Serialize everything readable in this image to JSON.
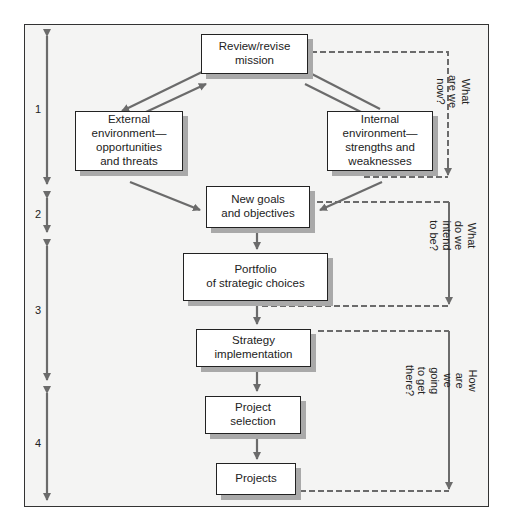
{
  "diagram": {
    "nodes": [
      {
        "id": "mission",
        "label": "Review/revise\nmission"
      },
      {
        "id": "external",
        "label": "External\nenvironment—\nopportunities\nand threats"
      },
      {
        "id": "internal",
        "label": "Internal\nenvironment—\nstrengths and\nweaknesses"
      },
      {
        "id": "goals",
        "label": "New goals\nand objectives"
      },
      {
        "id": "portfolio",
        "label": "Portfolio\nof strategic choices"
      },
      {
        "id": "implementation",
        "label": "Strategy\nimplementation"
      },
      {
        "id": "selection",
        "label": "Project\nselection"
      },
      {
        "id": "projects",
        "label": "Projects"
      }
    ],
    "phases": [
      "1",
      "2",
      "3",
      "4"
    ],
    "questions": [
      "What are we now?",
      "What do we\nintend to be?",
      "How are we going\nto get there?"
    ],
    "colors": {
      "arrow": "#6b6b6b",
      "frame_bg": "#f4f4f3",
      "shadow": "#a9a9a9",
      "border": "#222222"
    }
  }
}
